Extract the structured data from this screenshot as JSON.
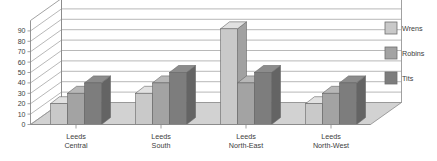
{
  "chart_data": {
    "type": "bar",
    "title": "",
    "subtitle": "",
    "xlabel": "",
    "ylabel": "",
    "categories": [
      "Leeds Central",
      "Leeds South",
      "Leeds North-East",
      "Leeds North-West"
    ],
    "category_lines": [
      [
        "Leeds",
        "Central"
      ],
      [
        "Leeds",
        "South"
      ],
      [
        "Leeds",
        "North-East"
      ],
      [
        "Leeds",
        "North-West"
      ]
    ],
    "series": [
      {
        "name": "Wrens",
        "color": "#c9c9c9",
        "values": [
          20,
          30,
          92,
          20
        ]
      },
      {
        "name": "Robins",
        "color": "#a3a3a3",
        "values": [
          30,
          40,
          40,
          30
        ]
      },
      {
        "name": "Tits",
        "color": "#7d7d7d",
        "values": [
          40,
          50,
          50,
          40
        ]
      }
    ],
    "ylim": [
      0,
      100
    ],
    "yticks": [
      0,
      10,
      20,
      30,
      40,
      50,
      60,
      70,
      80,
      90
    ],
    "ytick_labels": [
      "0",
      "10",
      "20",
      "30",
      "40",
      "50",
      "60",
      "70",
      "80",
      "90"
    ],
    "grid": true,
    "grid_axis": "y",
    "legend_position": "right",
    "style": "3d-bar",
    "axis_color": "#8a8a8a",
    "grid_color": "#9a9a9a",
    "floor_color": "#d2d2d2",
    "plot_background": "#ffffff",
    "text_color": "#3c3c3c"
  },
  "legend": {
    "entries": [
      {
        "label": "Wrens"
      },
      {
        "label": "Robins"
      },
      {
        "label": "Tits"
      }
    ]
  }
}
